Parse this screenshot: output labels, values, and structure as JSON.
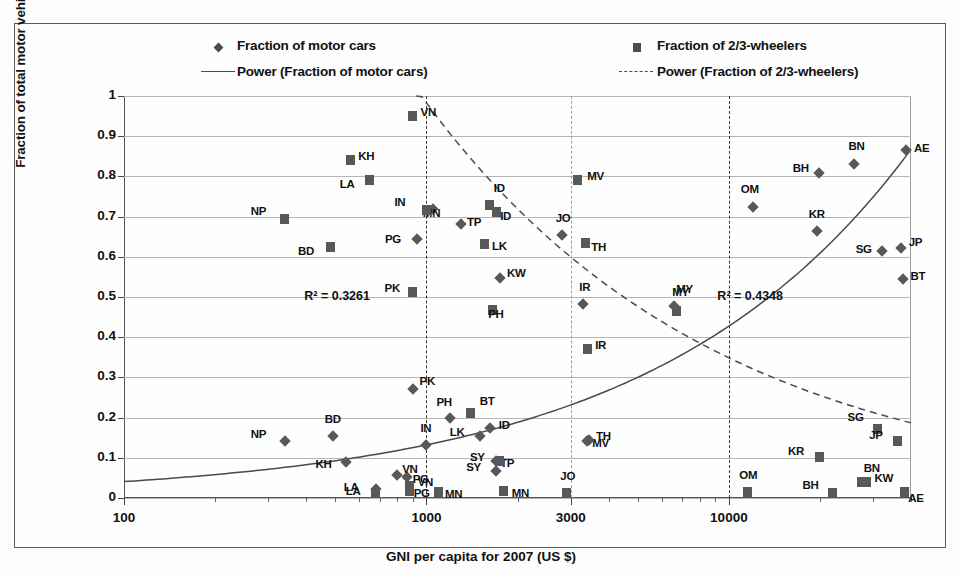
{
  "chart_data": {
    "type": "scatter",
    "title": "",
    "xlabel": "GNI per capita for 2007  (US $)",
    "ylabel": "Fraction of total motor vehicle fleet",
    "xscale": "log",
    "xlim": [
      100,
      40000
    ],
    "ylim": [
      0,
      1
    ],
    "xticks": [
      100,
      1000,
      3000,
      10000
    ],
    "xticklabels": [
      "100",
      "1000",
      "3000",
      "10000"
    ],
    "yticks": [
      0,
      0.1,
      0.2,
      0.3,
      0.4,
      0.5,
      0.6,
      0.7,
      0.8,
      0.9,
      1
    ],
    "yticklabels": [
      "0",
      "0.1",
      "0.2",
      "0.3",
      "0.4",
      "0.5",
      "0.6",
      "0.7",
      "0.8",
      "0.9",
      "1"
    ],
    "grid": "horizontal",
    "vertical_reference_lines": [
      1000,
      3000,
      10000
    ],
    "legend_position": "top",
    "legend": [
      {
        "label": "Fraction of motor cars",
        "marker": "diamond"
      },
      {
        "label": "Fraction of 2/3-wheelers",
        "marker": "square"
      },
      {
        "label": "Power (Fraction of motor cars)",
        "marker": "solid-line"
      },
      {
        "label": "Power (Fraction of 2/3-wheelers)",
        "marker": "dashed-line"
      }
    ],
    "annotations": [
      {
        "text": "R² = 0.3261",
        "x": 560,
        "y": 0.5,
        "series": "Fraction of 2/3-wheelers"
      },
      {
        "text": "R² = 0.4348",
        "x": 13000,
        "y": 0.5,
        "series": "Fraction of motor cars"
      }
    ],
    "series": [
      {
        "name": "Fraction of motor cars",
        "marker": "diamond",
        "points": [
          {
            "label": "NP",
            "x": 340,
            "y": 0.142
          },
          {
            "label": "KH",
            "x": 540,
            "y": 0.089
          },
          {
            "label": "LA",
            "x": 680,
            "y": 0.022
          },
          {
            "label": "BD",
            "x": 490,
            "y": 0.155
          },
          {
            "label": "PG",
            "x": 860,
            "y": 0.052
          },
          {
            "label": "VN",
            "x": 800,
            "y": 0.058
          },
          {
            "label": "IN",
            "x": 1000,
            "y": 0.133
          },
          {
            "label": "PH",
            "x": 1200,
            "y": 0.198
          },
          {
            "label": "LK",
            "x": 1500,
            "y": 0.153
          },
          {
            "label": "ID",
            "x": 1620,
            "y": 0.175
          },
          {
            "label": "SY",
            "x": 1700,
            "y": 0.068
          },
          {
            "label": "TP",
            "x": 1700,
            "y": 0.092
          },
          {
            "label": "PK",
            "x": 900,
            "y": 0.272
          },
          {
            "label": "PG",
            "x": 930,
            "y": 0.645
          },
          {
            "label": "MN",
            "x": 1050,
            "y": 0.718
          },
          {
            "label": "TP",
            "x": 1300,
            "y": 0.682
          },
          {
            "label": "KW",
            "x": 1750,
            "y": 0.548
          },
          {
            "label": "JO",
            "x": 2800,
            "y": 0.655
          },
          {
            "label": "IR",
            "x": 3300,
            "y": 0.482
          },
          {
            "label": "MV",
            "x": 3400,
            "y": 0.143
          },
          {
            "label": "TH",
            "x": 3450,
            "y": 0.145
          },
          {
            "label": "MY",
            "x": 6600,
            "y": 0.478
          },
          {
            "label": "OM",
            "x": 12000,
            "y": 0.723
          },
          {
            "label": "KR",
            "x": 19500,
            "y": 0.665
          },
          {
            "label": "BH",
            "x": 19800,
            "y": 0.808
          },
          {
            "label": "SG",
            "x": 32000,
            "y": 0.615
          },
          {
            "label": "JP",
            "x": 37000,
            "y": 0.622
          },
          {
            "label": "BT",
            "x": 37500,
            "y": 0.545
          },
          {
            "label": "BN",
            "x": 26000,
            "y": 0.832
          },
          {
            "label": "AE",
            "x": 38500,
            "y": 0.865
          }
        ]
      },
      {
        "name": "Fraction of 2/3-wheelers",
        "marker": "square",
        "points": [
          {
            "label": "NP",
            "x": 340,
            "y": 0.694
          },
          {
            "label": "BD",
            "x": 480,
            "y": 0.625
          },
          {
            "label": "KH",
            "x": 560,
            "y": 0.84
          },
          {
            "label": "LA",
            "x": 650,
            "y": 0.791
          },
          {
            "label": "VN",
            "x": 900,
            "y": 0.95
          },
          {
            "label": "IN",
            "x": 1000,
            "y": 0.716
          },
          {
            "label": "PK",
            "x": 900,
            "y": 0.512
          },
          {
            "label": "ID",
            "x": 1620,
            "y": 0.728
          },
          {
            "label": "ID",
            "x": 1700,
            "y": 0.712
          },
          {
            "label": "LK",
            "x": 1550,
            "y": 0.633
          },
          {
            "label": "PH",
            "x": 1650,
            "y": 0.468
          },
          {
            "label": "MV",
            "x": 3150,
            "y": 0.791
          },
          {
            "label": "TH",
            "x": 3350,
            "y": 0.635
          },
          {
            "label": "IR",
            "x": 3400,
            "y": 0.37
          },
          {
            "label": "MY",
            "x": 6700,
            "y": 0.465
          },
          {
            "label": "LA",
            "x": 680,
            "y": 0.012
          },
          {
            "label": "PG",
            "x": 880,
            "y": 0.018
          },
          {
            "label": "VN",
            "x": 880,
            "y": 0.03
          },
          {
            "label": "MN",
            "x": 1100,
            "y": 0.015
          },
          {
            "label": "BT",
            "x": 1400,
            "y": 0.212
          },
          {
            "label": "SY",
            "x": 1750,
            "y": 0.093
          },
          {
            "label": "MN",
            "x": 1800,
            "y": 0.018
          },
          {
            "label": "JO",
            "x": 2900,
            "y": 0.013
          },
          {
            "label": "OM",
            "x": 11500,
            "y": 0.015
          },
          {
            "label": "KR",
            "x": 20000,
            "y": 0.102
          },
          {
            "label": "BH",
            "x": 22000,
            "y": 0.013
          },
          {
            "label": "SG",
            "x": 31000,
            "y": 0.172
          },
          {
            "label": "JP",
            "x": 36000,
            "y": 0.143
          },
          {
            "label": "BN",
            "x": 27500,
            "y": 0.041
          },
          {
            "label": "KW",
            "x": 28500,
            "y": 0.04
          },
          {
            "label": "AE",
            "x": 38000,
            "y": 0.015
          }
        ]
      }
    ],
    "trendlines": [
      {
        "name": "Power (Fraction of motor cars)",
        "style": "solid",
        "r_squared": 0.4348
      },
      {
        "name": "Power (Fraction of 2/3-wheelers)",
        "style": "dashed",
        "r_squared": 0.3261
      }
    ]
  }
}
